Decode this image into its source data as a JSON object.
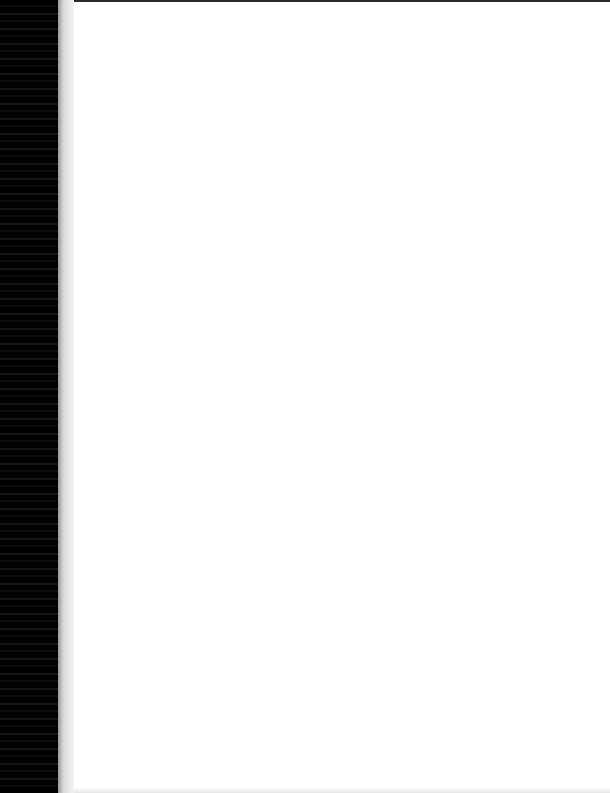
{
  "document": {
    "type": "scanned blank page",
    "content": ""
  }
}
